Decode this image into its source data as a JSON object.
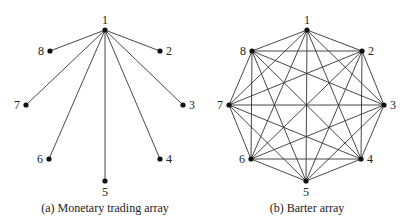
{
  "panels": [
    {
      "id": "monetary",
      "caption": "(a) Monetary trading array",
      "caption_pos": [
        105,
        212
      ],
      "topology": "star",
      "hub": "1",
      "nodes": [
        {
          "label": "1",
          "x": 105,
          "y": 30,
          "lx": 105,
          "ly": 24,
          "anchor": "middle"
        },
        {
          "label": "2",
          "x": 160,
          "y": 51,
          "lx": 166,
          "ly": 55,
          "anchor": "start"
        },
        {
          "label": "3",
          "x": 183,
          "y": 105,
          "lx": 189,
          "ly": 109,
          "anchor": "start"
        },
        {
          "label": "4",
          "x": 160,
          "y": 159,
          "lx": 166,
          "ly": 163,
          "anchor": "start"
        },
        {
          "label": "5",
          "x": 105,
          "y": 181,
          "lx": 105,
          "ly": 196,
          "anchor": "middle"
        },
        {
          "label": "6",
          "x": 49,
          "y": 159,
          "lx": 43,
          "ly": 163,
          "anchor": "end"
        },
        {
          "label": "7",
          "x": 26,
          "y": 105,
          "lx": 20,
          "ly": 109,
          "anchor": "end"
        },
        {
          "label": "8",
          "x": 50,
          "y": 51,
          "lx": 44,
          "ly": 55,
          "anchor": "end"
        }
      ]
    },
    {
      "id": "barter",
      "caption": "(b) Barter array",
      "caption_pos": [
        307,
        212
      ],
      "topology": "complete",
      "nodes": [
        {
          "label": "1",
          "x": 307,
          "y": 30,
          "lx": 307,
          "ly": 24,
          "anchor": "middle"
        },
        {
          "label": "2",
          "x": 362,
          "y": 51,
          "lx": 368,
          "ly": 55,
          "anchor": "start"
        },
        {
          "label": "3",
          "x": 384,
          "y": 105,
          "lx": 390,
          "ly": 109,
          "anchor": "start"
        },
        {
          "label": "4",
          "x": 361,
          "y": 159,
          "lx": 367,
          "ly": 163,
          "anchor": "start"
        },
        {
          "label": "5",
          "x": 306,
          "y": 181,
          "lx": 306,
          "ly": 196,
          "anchor": "middle"
        },
        {
          "label": "6",
          "x": 251,
          "y": 159,
          "lx": 245,
          "ly": 163,
          "anchor": "end"
        },
        {
          "label": "7",
          "x": 229,
          "y": 105,
          "lx": 223,
          "ly": 109,
          "anchor": "end"
        },
        {
          "label": "8",
          "x": 252,
          "y": 51,
          "lx": 246,
          "ly": 55,
          "anchor": "end"
        }
      ]
    }
  ]
}
